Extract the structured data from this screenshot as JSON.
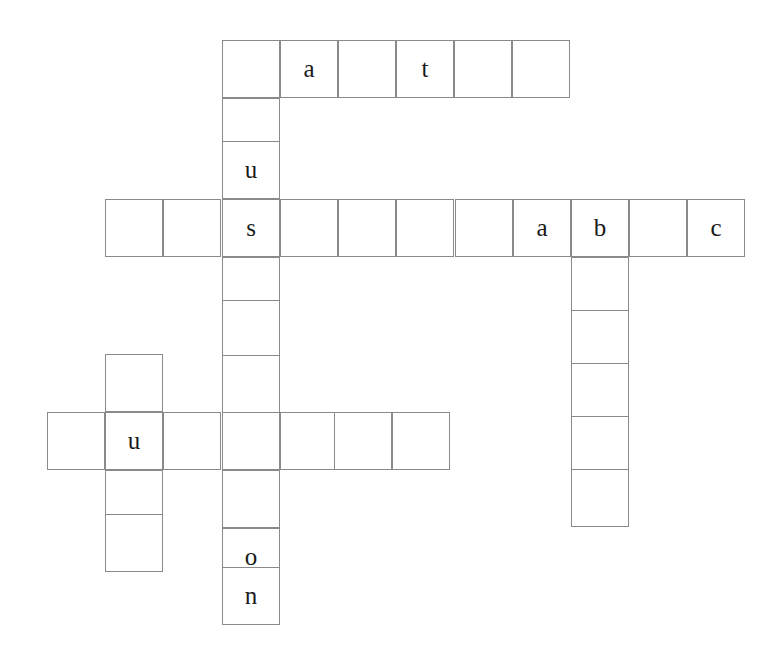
{
  "puzzle": {
    "kind": "crossword-grid",
    "title": "",
    "background_color": "#ffffff",
    "cell_border_color": "#8a8a8a",
    "letter_color": "#1a1a1a",
    "cell_size": 58,
    "canvas": {
      "width": 779,
      "height": 657
    },
    "filled_letters": [
      "a",
      "t",
      "u",
      "s",
      "a",
      "b",
      "c",
      "u",
      "o",
      "n"
    ],
    "entries": [
      {
        "id": "across-top",
        "name": "across-word-top",
        "direction": "across",
        "x": 222,
        "y": 40,
        "length": 6,
        "letters": [
          "",
          "a",
          "",
          "t",
          "",
          ""
        ]
      },
      {
        "id": "down-main",
        "name": "down-word-main",
        "direction": "down",
        "x": 222,
        "y": 40,
        "length": 10,
        "letters": [
          "",
          "",
          "u",
          "s",
          "",
          "",
          "",
          "",
          "o",
          "n"
        ]
      },
      {
        "id": "across-middle-left",
        "name": "across-word-middle-left",
        "direction": "across",
        "x": 105,
        "y": 198,
        "length": 6,
        "letters": [
          "",
          "",
          "s",
          "",
          "",
          ""
        ]
      },
      {
        "id": "across-middle-right",
        "name": "across-word-middle-right",
        "direction": "across",
        "x": 455,
        "y": 198,
        "length": 5,
        "letters": [
          "",
          "a",
          "b",
          "",
          "c"
        ]
      },
      {
        "id": "down-right",
        "name": "down-word-right",
        "direction": "down",
        "x": 571,
        "y": 198,
        "length": 6,
        "letters": [
          "b",
          "",
          "",
          "",
          "",
          ""
        ]
      },
      {
        "id": "across-lower",
        "name": "across-word-lower",
        "direction": "across",
        "x": 47,
        "y": 412,
        "length": 7,
        "letters": [
          "",
          "u",
          "",
          "",
          "",
          "",
          ""
        ]
      },
      {
        "id": "down-lower-left",
        "name": "down-word-lower-left",
        "direction": "down",
        "x": 105,
        "y": 354,
        "length": 4,
        "letters": [
          "",
          "u",
          "",
          ""
        ]
      }
    ],
    "cells": [
      {
        "name": "cell-r0c3",
        "x": 222,
        "y": 40,
        "letter": ""
      },
      {
        "name": "cell-r0c4",
        "x": 280,
        "y": 40,
        "letter": "a"
      },
      {
        "name": "cell-r0c5",
        "x": 338,
        "y": 40,
        "letter": ""
      },
      {
        "name": "cell-r0c6",
        "x": 396,
        "y": 40,
        "letter": "t"
      },
      {
        "name": "cell-r0c7",
        "x": 454,
        "y": 40,
        "letter": ""
      },
      {
        "name": "cell-r0c8",
        "x": 512,
        "y": 40,
        "letter": ""
      },
      {
        "name": "cell-r1c3",
        "x": 222,
        "y": 98,
        "letter": ""
      },
      {
        "name": "cell-r2c3",
        "x": 222,
        "y": 141,
        "letter": "u"
      },
      {
        "name": "cell-r3c3",
        "x": 222,
        "y": 199,
        "letter": "s"
      },
      {
        "name": "cell-r4c3",
        "x": 222,
        "y": 257,
        "letter": ""
      },
      {
        "name": "cell-r5c3",
        "x": 222,
        "y": 300,
        "letter": ""
      },
      {
        "name": "cell-r6c3",
        "x": 222,
        "y": 355,
        "letter": ""
      },
      {
        "name": "cell-r7c3",
        "x": 222,
        "y": 412,
        "letter": ""
      },
      {
        "name": "cell-r8c3",
        "x": 222,
        "y": 470,
        "letter": ""
      },
      {
        "name": "cell-r9c3",
        "x": 222,
        "y": 528,
        "letter": "o"
      },
      {
        "name": "cell-r10c3",
        "x": 222,
        "y": 567,
        "letter": "n"
      },
      {
        "name": "cell-r3c1",
        "x": 105,
        "y": 199,
        "letter": ""
      },
      {
        "name": "cell-r3c2",
        "x": 163,
        "y": 199,
        "letter": ""
      },
      {
        "name": "cell-r3c4",
        "x": 280,
        "y": 199,
        "letter": ""
      },
      {
        "name": "cell-r3c5",
        "x": 338,
        "y": 199,
        "letter": ""
      },
      {
        "name": "cell-r3c6",
        "x": 396,
        "y": 199,
        "letter": ""
      },
      {
        "name": "cell-r3c7b",
        "x": 455,
        "y": 199,
        "letter": ""
      },
      {
        "name": "cell-r3c8b",
        "x": 513,
        "y": 199,
        "letter": "a"
      },
      {
        "name": "cell-r3c9b",
        "x": 571,
        "y": 199,
        "letter": "b"
      },
      {
        "name": "cell-r3c10b",
        "x": 629,
        "y": 199,
        "letter": ""
      },
      {
        "name": "cell-r3c11b",
        "x": 687,
        "y": 199,
        "letter": "c"
      },
      {
        "name": "cell-r4c9",
        "x": 571,
        "y": 257,
        "letter": ""
      },
      {
        "name": "cell-r5c9",
        "x": 571,
        "y": 310,
        "letter": ""
      },
      {
        "name": "cell-r6c9",
        "x": 571,
        "y": 363,
        "letter": ""
      },
      {
        "name": "cell-r7c9",
        "x": 571,
        "y": 416,
        "letter": ""
      },
      {
        "name": "cell-r8c9",
        "x": 571,
        "y": 469,
        "letter": ""
      },
      {
        "name": "cell-r6c1",
        "x": 105,
        "y": 354,
        "letter": ""
      },
      {
        "name": "cell-r7c1",
        "x": 105,
        "y": 412,
        "letter": "u"
      },
      {
        "name": "cell-r8c1",
        "x": 105,
        "y": 470,
        "letter": ""
      },
      {
        "name": "cell-r9c1",
        "x": 105,
        "y": 514,
        "letter": ""
      },
      {
        "name": "cell-r7c0",
        "x": 47,
        "y": 412,
        "letter": ""
      },
      {
        "name": "cell-r7c2",
        "x": 163,
        "y": 412,
        "letter": ""
      },
      {
        "name": "cell-r7c4",
        "x": 280,
        "y": 412,
        "letter": ""
      },
      {
        "name": "cell-r7c5",
        "x": 334,
        "y": 412,
        "letter": ""
      },
      {
        "name": "cell-r7c6",
        "x": 392,
        "y": 412,
        "letter": ""
      }
    ]
  }
}
